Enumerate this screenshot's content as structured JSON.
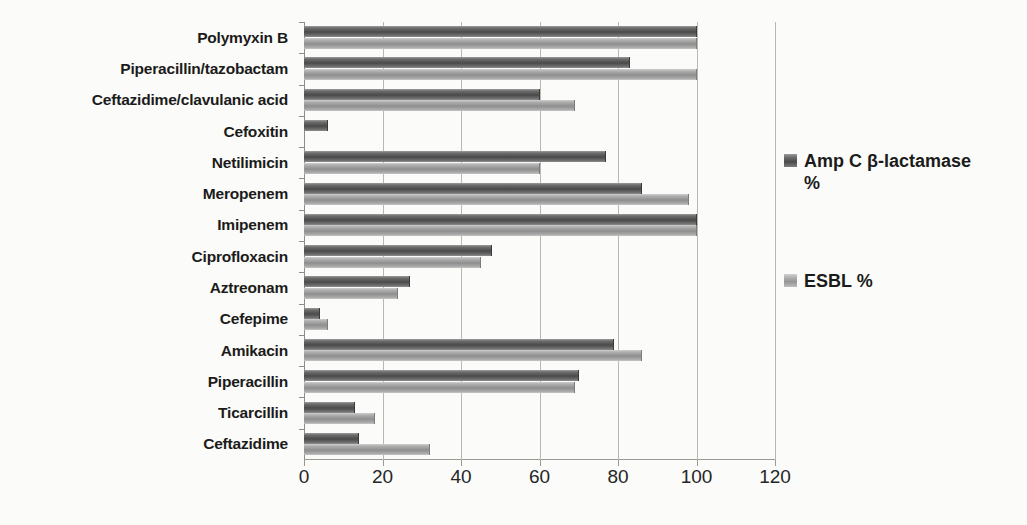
{
  "chart_data": {
    "type": "bar",
    "orientation": "horizontal",
    "title": "",
    "xlabel": "",
    "ylabel": "",
    "xlim": [
      0,
      120
    ],
    "xticks": [
      0,
      20,
      40,
      60,
      80,
      100,
      120
    ],
    "grid": true,
    "legend_position": "right",
    "categories": [
      "Ceftazidime",
      "Ticarcillin",
      "Piperacillin",
      "Amikacin",
      "Cefepime",
      "Aztreonam",
      "Ciprofloxacin",
      "Imipenem",
      "Meropenem",
      "Netilimicin",
      "Cefoxitin",
      "Ceftazidime/clavulanic acid",
      "Piperacillin/tazobactam",
      "Polymyxin B"
    ],
    "series": [
      {
        "name": "Amp C β-lactamase %",
        "color": "#595959",
        "values": [
          14,
          13,
          70,
          79,
          4,
          27,
          48,
          100,
          86,
          77,
          6,
          60,
          83,
          100
        ]
      },
      {
        "name": "ESBL %",
        "color": "#a6a6a6",
        "values": [
          32,
          18,
          69,
          86,
          6,
          24,
          45,
          100,
          98,
          60,
          0,
          69,
          100,
          100
        ]
      }
    ]
  },
  "legend": {
    "entries": [
      {
        "label": "Amp C β-lactamase\n%",
        "swatch": "amp-c-swatch"
      },
      {
        "label": "ESBL %",
        "swatch": "esbl-swatch"
      }
    ]
  },
  "axis": {
    "x_tick_labels": [
      "0",
      "20",
      "40",
      "60",
      "80",
      "100",
      "120"
    ]
  }
}
